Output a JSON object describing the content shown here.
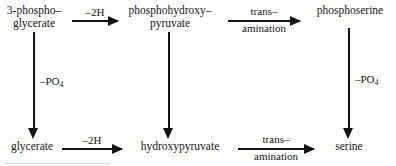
{
  "diagram": {
    "ink_color": "#131313",
    "background_color": "#fdfdfb",
    "nodes": [
      {
        "id": "3-phosphoglycerate",
        "line1": "3-phospho–",
        "line2": "glycerate"
      },
      {
        "id": "phosphohydroxypyruvate",
        "line1": "phosphohydroxy–",
        "line2": "pyruvate"
      },
      {
        "id": "phosphoserine",
        "line1": "phosphoserine",
        "line2": ""
      },
      {
        "id": "glycerate",
        "line1": "glycerate",
        "line2": ""
      },
      {
        "id": "hydroxypyruvate",
        "line1": "hydroxypyruvate",
        "line2": ""
      },
      {
        "id": "serine",
        "line1": "serine",
        "line2": ""
      }
    ],
    "horizontal_arrows": [
      {
        "id": "top-left",
        "label_top": "–2H",
        "label_bottom": ""
      },
      {
        "id": "top-right",
        "label_top": "trans–",
        "label_bottom": "amination"
      },
      {
        "id": "bottom-left",
        "label_top": "–2H",
        "label_bottom": ""
      },
      {
        "id": "bottom-right",
        "label_top": "trans–",
        "label_bottom": "amination"
      }
    ],
    "vertical_arrows": [
      {
        "id": "left",
        "label_prefix": "–PO",
        "label_sub": "4"
      },
      {
        "id": "middle",
        "label_prefix": "",
        "label_sub": ""
      },
      {
        "id": "right",
        "label_prefix": "–PO",
        "label_sub": "4"
      }
    ]
  }
}
